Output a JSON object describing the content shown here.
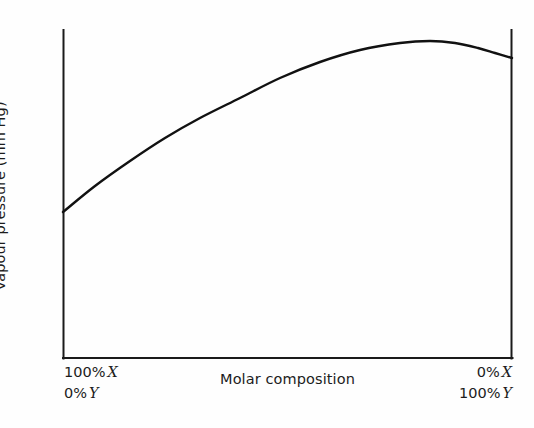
{
  "figure": {
    "background_color": "#fefefe",
    "line_color": "#111111",
    "axis_color": "#1a1a1a"
  },
  "axes": {
    "y_title": "Vapour pressure (mm Hg)",
    "x_title": "Molar composition",
    "left_corner": {
      "top_value": "100%",
      "top_symbol": "X",
      "bottom_value": "0%",
      "bottom_symbol": "Y"
    },
    "right_corner": {
      "top_value": "0%",
      "top_symbol": "X",
      "bottom_value": "100%",
      "bottom_symbol": "Y"
    }
  },
  "chart_data": {
    "type": "line",
    "title": "",
    "subtitle": "",
    "xlabel": "Molar composition",
    "ylabel": "Vapour pressure (mm Hg)",
    "grid": false,
    "legend": null,
    "legend_position": "none",
    "xlim": [
      0,
      100
    ],
    "ylim": [
      0,
      100
    ],
    "x_tick_labels": [
      "100% X / 0% Y",
      "0% X / 100% Y"
    ],
    "y_tick_labels": [],
    "annotations": [
      "Positive deviation from Raoult's law: total vapour pressure curve shows a maximum"
    ],
    "series": [
      {
        "name": "Total vapour pressure",
        "x": [
          0,
          5,
          10,
          15,
          20,
          25,
          30,
          35,
          40,
          45,
          50,
          55,
          60,
          65,
          70,
          75,
          80,
          85,
          90,
          95,
          100
        ],
        "y": [
          45,
          50,
          55,
          59,
          64,
          68,
          72,
          76,
          79,
          83,
          86,
          89,
          92,
          94,
          95.5,
          96.5,
          96.8,
          96.5,
          95.5,
          93.5,
          90
        ]
      }
    ],
    "pixel_geometry": {
      "plot_left": 63,
      "plot_right": 512,
      "plot_top": 30,
      "plot_bottom": 358,
      "curve_points": [
        [
          63,
          212
        ],
        [
          95,
          186
        ],
        [
          130,
          161
        ],
        [
          165,
          138
        ],
        [
          200,
          118
        ],
        [
          240,
          98
        ],
        [
          280,
          78
        ],
        [
          320,
          62
        ],
        [
          360,
          50
        ],
        [
          400,
          43
        ],
        [
          430,
          41
        ],
        [
          455,
          43
        ],
        [
          478,
          48
        ],
        [
          495,
          53
        ],
        [
          512,
          58
        ]
      ]
    }
  }
}
